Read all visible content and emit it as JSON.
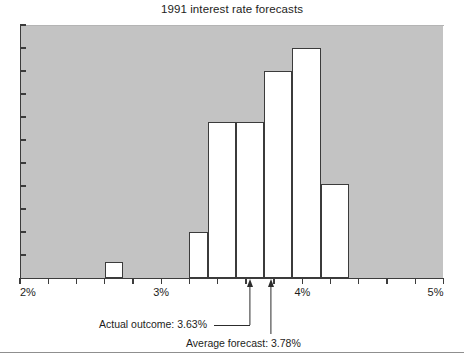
{
  "chart_data": {
    "type": "bar",
    "title": "1991 interest rate forecasts",
    "subtitle": "",
    "xlabel": "",
    "ylabel": "",
    "xlim": [
      2,
      5
    ],
    "ylim": [
      0,
      11
    ],
    "grid": false,
    "legend": null,
    "x_tick_labels": [
      "2%",
      "3%",
      "4%",
      "5%"
    ],
    "x_tick_values": [
      2,
      3,
      4,
      5
    ],
    "x_minor_tick_values": [
      2.2,
      2.4,
      2.6,
      2.8,
      3.2,
      3.4,
      3.6,
      3.8,
      4.2,
      4.4,
      4.6,
      4.8
    ],
    "y_tick_labels": [],
    "y_tick_count": 11,
    "bar_edge_color": "#3b3b3b",
    "bar_fill_color": "#ffffff",
    "plot_background_color": "#c3c3c3",
    "bins": [
      {
        "label": "2.60%-2.73%",
        "x_start": 2.6,
        "x_end": 2.73,
        "value": 0.7
      },
      {
        "label": "3.20%-3.33%",
        "x_start": 3.2,
        "x_end": 3.33,
        "value": 2.0
      },
      {
        "label": "3.33%-3.53%",
        "x_start": 3.33,
        "x_end": 3.53,
        "value": 6.8
      },
      {
        "label": "3.53%-3.73%",
        "x_start": 3.53,
        "x_end": 3.73,
        "value": 6.8
      },
      {
        "label": "3.73%-3.93%",
        "x_start": 3.73,
        "x_end": 3.93,
        "value": 9.0
      },
      {
        "label": "3.93%-4.13%",
        "x_start": 3.93,
        "x_end": 4.13,
        "value": 10.0
      },
      {
        "label": "4.13%-4.33%",
        "x_start": 4.13,
        "x_end": 4.33,
        "value": 4.1
      }
    ],
    "markers": [
      {
        "name": "actual-outcome",
        "label": "Actual outcome: 3.63%",
        "value": 3.63
      },
      {
        "name": "average-forecast",
        "label": "Average forecast: 3.78%",
        "value": 3.78
      }
    ],
    "annotations": [
      "Actual outcome: 3.63%",
      "Average forecast: 3.78%"
    ]
  }
}
